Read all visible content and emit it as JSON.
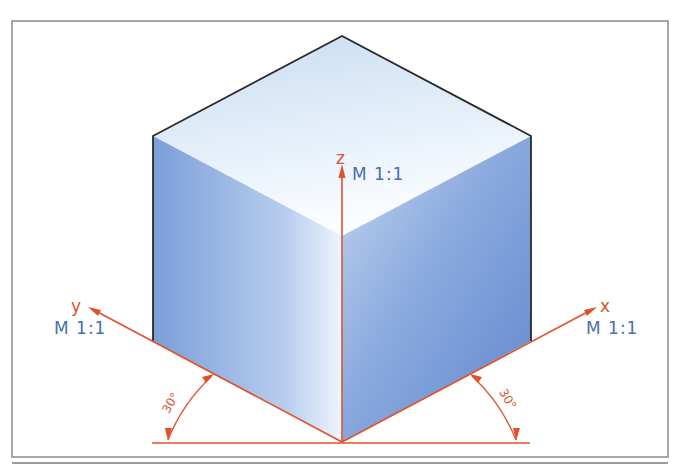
{
  "figure": {
    "colors": {
      "axis": "#e0522e",
      "label_blue": "#4a6fae",
      "cube_edge": "#2a2a2a",
      "frame": "#8a8a8a",
      "face_top": "#dce9f7",
      "face_left": "#7ea0d8",
      "face_right": "#6f93d2"
    },
    "axes": {
      "z": {
        "letter": "z",
        "scale": "M 1:1"
      },
      "y": {
        "letter": "y",
        "scale": "M 1:1"
      },
      "x": {
        "letter": "x",
        "scale": "M 1:1"
      }
    },
    "angles": {
      "left": "30°",
      "right": "30°"
    }
  }
}
